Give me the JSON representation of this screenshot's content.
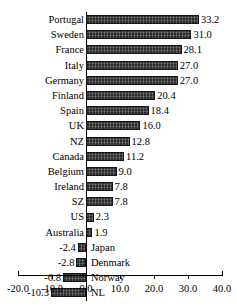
{
  "chart_data": {
    "type": "bar",
    "orientation": "horizontal",
    "title": "",
    "subtitle": "",
    "xlabel": "",
    "ylabel": "",
    "xlim": [
      -20.0,
      40.0
    ],
    "grid": false,
    "legend": null,
    "value_label_format": "one-decimal",
    "axis_ticks": [
      "-20.0",
      "-10.0",
      "0.0",
      "10.0",
      "20.0",
      "30.0",
      "40.0"
    ],
    "axis_tick_values": [
      -20.0,
      -10.0,
      0.0,
      10.0,
      20.0,
      30.0,
      40.0
    ],
    "categories": [
      "Portugal",
      "Sweden",
      "France",
      "Italy",
      "Germany",
      "Finland",
      "Spain",
      "UK",
      "NZ",
      "Canada",
      "Belgium",
      "Ireland",
      "SZ",
      "US",
      "Australia",
      "Japan",
      "Denmark",
      "Norway",
      "NL"
    ],
    "values": [
      33.2,
      31.0,
      28.1,
      27.0,
      27.0,
      20.4,
      18.4,
      16.0,
      12.8,
      11.2,
      9.0,
      7.8,
      7.8,
      2.3,
      1.9,
      -2.4,
      -2.8,
      -6.8,
      -10.3
    ],
    "value_labels": [
      "33.2",
      "31.0",
      "28.1",
      "27.0",
      "27.0",
      "20.4",
      "18.4",
      "16.0",
      "12.8",
      "11.2",
      "9.0",
      "7.8",
      "7.8",
      "2.3",
      "1.9",
      "-2.4",
      "-2.8",
      "-6.8",
      "-10.3"
    ],
    "bar_color": "#2b2b2b",
    "bar_edge_color": "#151515"
  }
}
